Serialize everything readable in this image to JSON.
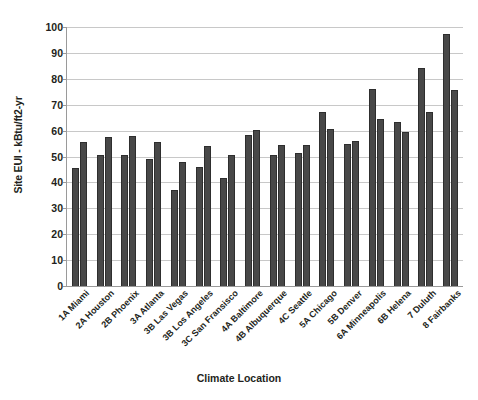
{
  "chart_data": {
    "type": "bar",
    "title": "",
    "xlabel": "Climate Location",
    "ylabel": "Site EUI - kBtu/ft2-yr",
    "ylim": [
      0,
      100
    ],
    "yticks": [
      0,
      10,
      20,
      30,
      40,
      50,
      60,
      70,
      80,
      90,
      100
    ],
    "grid": true,
    "legend": "none",
    "bar_color": "#484848",
    "categories": [
      "1A Miami",
      "2A Houston",
      "2B Phoenix",
      "3A Atlanta",
      "3B Las Vegas",
      "3B Los Angeles",
      "3C San Fransisco",
      "4A Baltimore",
      "4B Albuquerque",
      "4C Seattle",
      "5A Chicago",
      "5B Denver",
      "6A Minneapolis",
      "6B Helena",
      "7 Duluth",
      "8 Fairbanks"
    ],
    "series": [
      {
        "name": "Series 1",
        "values": [
          45.7,
          50.5,
          50.4,
          49.1,
          36.9,
          45.9,
          41.6,
          58.4,
          50.4,
          51.3,
          67.1,
          55.0,
          76.0,
          63.5,
          84.2,
          97.3
        ]
      },
      {
        "name": "Series 2",
        "values": [
          55.7,
          57.5,
          57.8,
          55.5,
          48.0,
          54.2,
          50.4,
          60.3,
          54.5,
          54.5,
          60.5,
          56.1,
          64.3,
          59.5,
          67.1,
          75.5
        ]
      }
    ]
  }
}
